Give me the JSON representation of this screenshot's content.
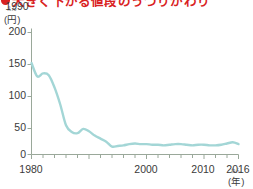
{
  "headline": {
    "bullet_color": "#d92121",
    "text": "大きく下がる値段のうつりかわり",
    "clipped": true
  },
  "axes": {
    "y_unit": "(円)",
    "y_unit_ruby": "えん",
    "x_unit": "(年)",
    "x_unit_ruby": "ねん",
    "y_ticks": [
      "0",
      "50",
      "100",
      "150",
      "200"
    ],
    "x_ticks": [
      "1980",
      "1990",
      "2000",
      "2010",
      "2016"
    ],
    "axis_color": "#9aa89a"
  },
  "chart_data": {
    "type": "line",
    "title": "大きく下がる値段のうつりかわり",
    "xlabel": "(年)",
    "ylabel": "(円)",
    "xlim": [
      1980,
      2016
    ],
    "ylim": [
      0,
      200
    ],
    "grid": false,
    "legend": "none",
    "line_color": "#a3d6d6",
    "series": [
      {
        "name": "値段",
        "x": [
          1980,
          1981,
          1982,
          1983,
          1984,
          1985,
          1986,
          1987,
          1988,
          1989,
          1990,
          1991,
          1992,
          1993,
          1994,
          1995,
          1996,
          1997,
          1998,
          1999,
          2000,
          2001,
          2002,
          2003,
          2004,
          2005,
          2006,
          2007,
          2008,
          2009,
          2010,
          2011,
          2012,
          2013,
          2014,
          2015,
          2016
        ],
        "values": [
          150,
          128,
          133,
          130,
          110,
          82,
          48,
          37,
          35,
          42,
          38,
          31,
          26,
          21,
          13,
          14,
          15,
          17,
          18,
          17,
          17,
          16,
          16,
          15,
          16,
          17,
          17,
          16,
          15,
          16,
          16,
          15,
          15,
          16,
          18,
          20,
          17
        ]
      }
    ]
  }
}
